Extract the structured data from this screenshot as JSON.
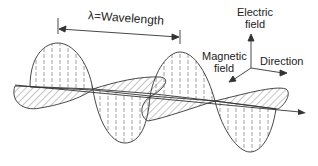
{
  "diagram": {
    "wavelength_label": "λ=Wavelength",
    "axes": {
      "electric_label_line1": "Electric",
      "electric_label_line2": "field",
      "magnetic_label_line1": "Magnetic",
      "magnetic_label_line2": "field",
      "direction_label": "Direction"
    },
    "colors": {
      "line": "#333333",
      "hatch": "#666666",
      "background": "#ffffff"
    }
  }
}
